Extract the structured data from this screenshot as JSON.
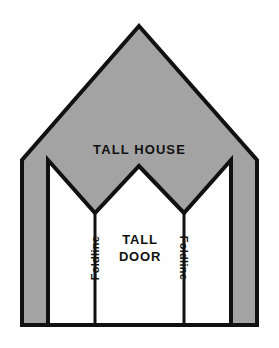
{
  "diagram": {
    "title": "TALL HOUSE",
    "door_label_line1": "TALL",
    "door_label_line2": "DOOR",
    "foldline_left": "Foldline",
    "foldline_right": "Foldline",
    "colors": {
      "wall_fill": "#a3a3a3",
      "outline": "#111111",
      "door_fill": "#ffffff",
      "background": "#ffffff",
      "text": "#111111"
    },
    "geometry": {
      "apex": [
        139,
        26
      ],
      "eave_left": [
        22,
        160
      ],
      "eave_right": [
        257,
        160
      ],
      "base_left": [
        22,
        325
      ],
      "base_right": [
        257,
        325
      ],
      "door_peak_left": [
        48,
        160
      ],
      "door_peak_center": [
        139,
        166
      ],
      "door_peak_right": [
        231,
        160
      ],
      "door_valley_left": [
        95,
        213
      ],
      "door_valley_right": [
        184,
        213
      ],
      "foldline_left_x": 95,
      "foldline_right_x": 184,
      "baseline_y": 325,
      "stroke_width": 4
    }
  }
}
